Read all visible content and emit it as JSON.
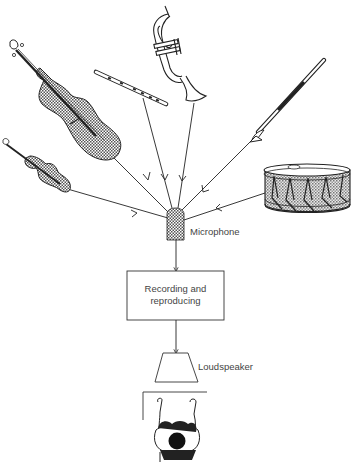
{
  "diagram": {
    "sources": [
      {
        "name": "double-bass",
        "icon": "double-bass-icon"
      },
      {
        "name": "violin",
        "icon": "violin-icon"
      },
      {
        "name": "flute",
        "icon": "flute-icon"
      },
      {
        "name": "trumpet",
        "icon": "trumpet-icon"
      },
      {
        "name": "clarinet",
        "icon": "clarinet-icon"
      },
      {
        "name": "drum",
        "icon": "drum-icon"
      }
    ],
    "microphone_label": "Microphone",
    "processor_label_line1": "Recording and",
    "processor_label_line2": "reproducing",
    "loudspeaker_label": "Loudspeaker",
    "caption": "",
    "colors": {
      "line": "#222222",
      "hatch": "#9a9a9a",
      "label": "#444444"
    }
  }
}
